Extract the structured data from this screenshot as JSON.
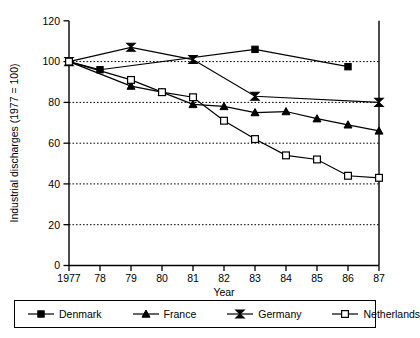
{
  "chart_data": {
    "type": "line",
    "title": "",
    "xlabel": "Year",
    "ylabel": "Industrial discharges (1977 = 100)",
    "x": [
      1977,
      1978,
      1979,
      1980,
      1981,
      1982,
      1983,
      1984,
      1985,
      1986,
      1987
    ],
    "xtick_labels": [
      "1977",
      "78",
      "79",
      "80",
      "81",
      "82",
      "83",
      "84",
      "85",
      "86",
      "87"
    ],
    "ytick_labels": [
      "0",
      "20",
      "40",
      "60",
      "80",
      "100",
      "120"
    ],
    "yticks": [
      0,
      20,
      40,
      60,
      80,
      100,
      120
    ],
    "ylim": [
      0,
      120
    ],
    "xlim": [
      1977,
      1987
    ],
    "grid": "horizontal-dotted",
    "legend_position": "below-plot",
    "series": [
      {
        "name": "Denmark",
        "marker": "filled-square",
        "x": [
          1977,
          1978,
          1983,
          1986
        ],
        "values": [
          100,
          96,
          106,
          97.5
        ]
      },
      {
        "name": "France",
        "marker": "filled-triangle",
        "x": [
          1977,
          1979,
          1980,
          1981,
          1982,
          1983,
          1984,
          1985,
          1986,
          1987
        ],
        "values": [
          100,
          88,
          85,
          79,
          78,
          75,
          75.5,
          72,
          69,
          66
        ]
      },
      {
        "name": "Germany",
        "marker": "bowtie",
        "x": [
          1977,
          1979,
          1981,
          1983,
          1987
        ],
        "values": [
          100,
          107,
          101,
          83,
          80
        ]
      },
      {
        "name": "Netherlands",
        "marker": "open-square",
        "x": [
          1977,
          1979,
          1980,
          1981,
          1982,
          1983,
          1984,
          1985,
          1986,
          1987
        ],
        "values": [
          100,
          91,
          85,
          82.5,
          71,
          62,
          54,
          52,
          44,
          43
        ]
      }
    ]
  },
  "axes": {
    "y_title": "Industrial discharges (1977 = 100)",
    "x_title": "Year"
  },
  "legend": {
    "items": [
      {
        "label": "Denmark",
        "marker": "filled-square"
      },
      {
        "label": "France",
        "marker": "filled-triangle"
      },
      {
        "label": "Germany",
        "marker": "bowtie"
      },
      {
        "label": "Netherlands",
        "marker": "open-square"
      }
    ]
  },
  "colors": {
    "line": "#000000",
    "grid": "#000000",
    "background": "#ffffff"
  }
}
